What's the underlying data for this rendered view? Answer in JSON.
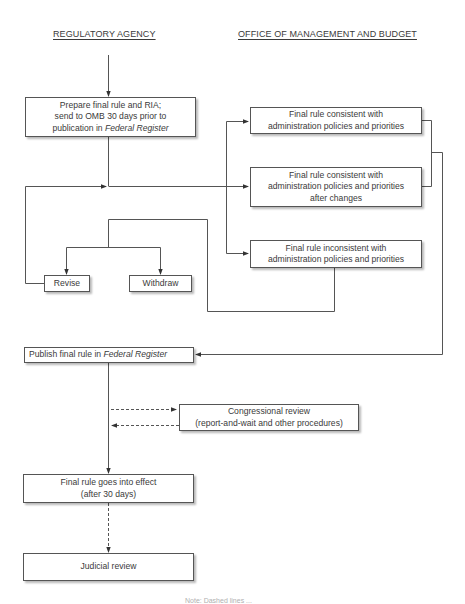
{
  "headers": {
    "left": "REGULATORY AGENCY",
    "right": "OFFICE OF MANAGEMENT AND BUDGET"
  },
  "boxes": {
    "prepare": {
      "line1": "Prepare final rule and RIA;",
      "line2": "send to OMB 30 days prior to",
      "line3_prefix": "publication in ",
      "line3_italic": "Federal Register"
    },
    "consistent": {
      "line1": "Final rule consistent with",
      "line2": "administration policies and priorities"
    },
    "consistent_after_changes": {
      "line1": "Final rule consistent with",
      "line2": "administration policies and priorities",
      "line3": "after changes"
    },
    "inconsistent": {
      "line1": "Final rule inconsistent with",
      "line2": "administration policies and priorities"
    },
    "revise": {
      "label": "Revise"
    },
    "withdraw": {
      "label": "Withdraw"
    },
    "publish": {
      "prefix": "Publish final rule in ",
      "italic": "Federal Register"
    },
    "congressional": {
      "line1": "Congressional review",
      "line2": "(report-and-wait and other procedures)"
    },
    "effect": {
      "line1": "Final rule goes into effect",
      "line2": "(after 30 days)"
    },
    "judicial": {
      "label": "Judicial review"
    }
  },
  "edges": [
    {
      "from": "start",
      "to": "prepare",
      "style": "solid"
    },
    {
      "from": "prepare",
      "to": "consistent_after_changes",
      "style": "solid"
    },
    {
      "from": "prepare",
      "to": "consistent",
      "style": "solid"
    },
    {
      "from": "prepare",
      "to": "inconsistent",
      "style": "solid"
    },
    {
      "from": "inconsistent",
      "to": "revise",
      "style": "solid"
    },
    {
      "from": "inconsistent",
      "to": "withdraw",
      "style": "solid"
    },
    {
      "from": "revise",
      "to": "prepare_flow",
      "style": "solid"
    },
    {
      "from": "consistent",
      "to": "publish",
      "style": "solid"
    },
    {
      "from": "consistent_after_changes",
      "to": "publish",
      "style": "solid"
    },
    {
      "from": "publish",
      "to": "congressional",
      "style": "dashed"
    },
    {
      "from": "congressional",
      "to": "publish_flow",
      "style": "dashed"
    },
    {
      "from": "publish",
      "to": "effect",
      "style": "solid"
    },
    {
      "from": "effect",
      "to": "judicial",
      "style": "dashed"
    }
  ],
  "footnote": "Note: Dashed lines ..."
}
